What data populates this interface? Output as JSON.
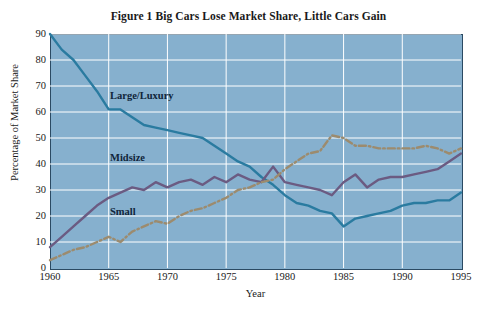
{
  "chart_data": {
    "type": "line",
    "title": "Figure 1  Big Cars Lose Market Share, Little Cars Gain",
    "xlabel": "Year",
    "ylabel": "Percentage of Market Share",
    "xlim": [
      1960,
      1995
    ],
    "ylim": [
      0,
      90
    ],
    "xticks": [
      1960,
      1965,
      1970,
      1975,
      1980,
      1985,
      1990,
      1995
    ],
    "yticks": [
      0,
      10,
      20,
      30,
      40,
      50,
      60,
      70,
      80,
      90
    ],
    "grid": true,
    "legend": "inline-labels",
    "plot_background": "#86b0ce",
    "x": [
      1960,
      1961,
      1962,
      1963,
      1964,
      1965,
      1966,
      1967,
      1968,
      1969,
      1970,
      1971,
      1972,
      1973,
      1974,
      1975,
      1976,
      1977,
      1978,
      1979,
      1980,
      1981,
      1982,
      1983,
      1984,
      1985,
      1986,
      1987,
      1988,
      1989,
      1990,
      1991,
      1992,
      1993,
      1994,
      1995
    ],
    "series": [
      {
        "name": "Large/Luxury",
        "color": "#2a7ba0",
        "style": "solid",
        "label": "Large/Luxury",
        "values": [
          90,
          84,
          80,
          74,
          68,
          61,
          61,
          58,
          55,
          54,
          53,
          52,
          51,
          50,
          47,
          44,
          41,
          39,
          35,
          32,
          28,
          25,
          24,
          22,
          21,
          16,
          19,
          20,
          21,
          22,
          24,
          25,
          25,
          26,
          26,
          29
        ]
      },
      {
        "name": "Midsize",
        "color": "#6b5b82",
        "style": "solid",
        "label": "Midsize",
        "values": [
          8,
          12,
          16,
          20,
          24,
          27,
          29,
          31,
          30,
          33,
          31,
          33,
          34,
          32,
          35,
          33,
          36,
          34,
          33,
          39,
          33,
          32,
          31,
          30,
          28,
          33,
          36,
          31,
          34,
          35,
          35,
          36,
          37,
          38,
          41,
          44
        ]
      },
      {
        "name": "Small",
        "color": "#9c8b6e",
        "style": "dash-dot",
        "label": "Small",
        "values": [
          3,
          5,
          7,
          8,
          10,
          12,
          10,
          14,
          16,
          18,
          17,
          20,
          22,
          23,
          25,
          27,
          30,
          31,
          33,
          34,
          38,
          41,
          44,
          45,
          51,
          50,
          47,
          47,
          46,
          46,
          46,
          46,
          47,
          46,
          44,
          46
        ]
      }
    ]
  }
}
